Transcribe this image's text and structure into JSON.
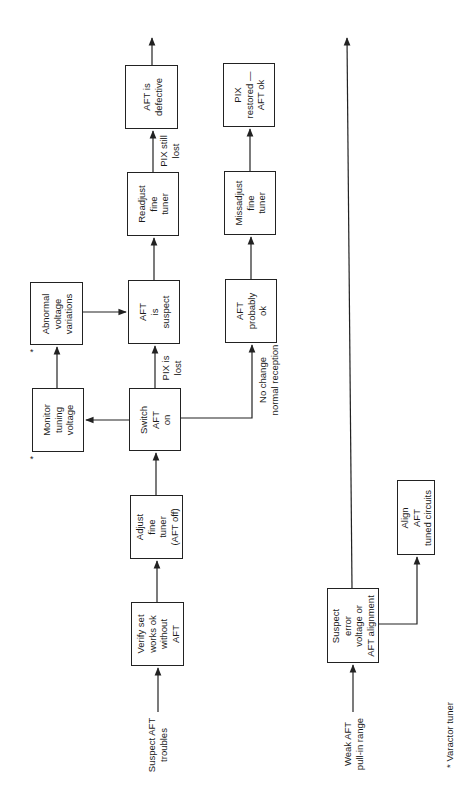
{
  "diagram": {
    "orientation": "rotated 90 degrees counter-clockwise",
    "boxes": {
      "verify_set": "Verify set\nworks ok\nwithout\nAFT",
      "adjust_fine_tuner": "Adjust\nfine\ntuner\n(AFT off)",
      "switch_aft_on": "Switch\nAFT\non",
      "monitor_tuning_voltage": "Monitor\ntuning\nvoltage",
      "abnormal_voltage": "Abnormal\nvoltage\nvariations",
      "aft_is_suspect": "AFT\nis\nsuspect",
      "readjust_fine_tuner": "Readjust\nfine\ntuner",
      "aft_is_defective": "AFT is\ndefective",
      "aft_probably_ok": "AFT\nprobably\nok",
      "missadjust_fine_tuner": "Missadjust\nfine\ntuner",
      "pix_restored": "PIX\nrestored —\nAFT ok",
      "suspect_error_voltage": "Suspect\nerror\nvoltage or\nAFT alignment",
      "align_aft": "Align\nAFT\ntuned circuits"
    },
    "inputs": {
      "suspect_aft_troubles": "Suspect AFT\ntroubles",
      "weak_aft_pull_in": "Weak AFT\npull-in range"
    },
    "edge_labels": {
      "pix_is_lost": "PIX is\nlost",
      "pix_still_lost": "PIX still\nlost",
      "no_change": "No change\nnormal reception"
    },
    "markers": {
      "asterisk": "*"
    },
    "footnote": "* Varactor tuner"
  }
}
